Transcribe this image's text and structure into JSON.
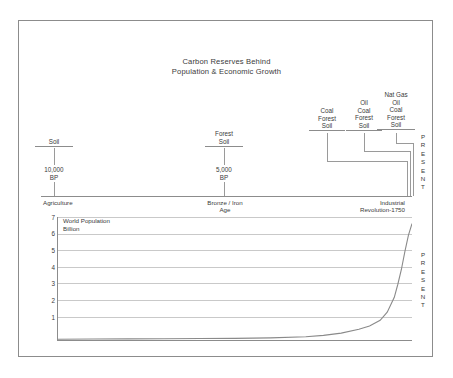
{
  "title": {
    "line1": "Carbon Reserves Behind",
    "line2": "Population & Economic Growth"
  },
  "reserve_groups": [
    {
      "name": "group-soil-10000bp",
      "lines": [
        "Soil"
      ],
      "marker": "10,000\nBP",
      "marker_line1": "10,000",
      "marker_line2": "BP"
    },
    {
      "name": "group-forest-soil-5000bp",
      "lines": [
        "Forest",
        "Soil"
      ],
      "marker_line1": "5,000",
      "marker_line2": "BP"
    },
    {
      "name": "group-coal-forest-soil",
      "lines": [
        "Coal",
        "Forest",
        "Soil"
      ]
    },
    {
      "name": "group-oil-coal-forest-soil",
      "lines": [
        "Oil",
        "Coal",
        "Forest",
        "Soil"
      ]
    },
    {
      "name": "group-natgas-oil-coal-forest-soil",
      "lines": [
        "Nat Gas",
        "Oil",
        "Coal",
        "Forest",
        "Soil"
      ]
    }
  ],
  "labels": {
    "soil": "Soil",
    "forest": "Forest",
    "coal": "Coal",
    "oil": "Oil",
    "nat_gas": "Nat Gas",
    "bp_10000_l1": "10,000",
    "bp_10000_l2": "BP",
    "bp_5000_l1": "5,000",
    "bp_5000_l2": "BP",
    "present": "PRESENT"
  },
  "eras": [
    {
      "label": "Agriculture",
      "align": "left"
    },
    {
      "label_line1": "Bronze / Iron",
      "label_line2": "Age",
      "align": "center"
    },
    {
      "label_line1": "Industrial",
      "label_line2": "Revolution-1750",
      "align": "right"
    }
  ],
  "era_text": {
    "agriculture": "Agriculture",
    "bronze_iron_1": "Bronze / Iron",
    "bronze_iron_2": "Age",
    "industrial_1": "Industrial",
    "industrial_2": "Revolution-1750"
  },
  "chart_data": {
    "type": "line",
    "title": "World Population",
    "subtitle": "Billion",
    "ylabel_line1": "World Population",
    "ylabel_line2": "Billion",
    "xlabel": "",
    "ylim": [
      0,
      7.5
    ],
    "yticks": [
      7,
      6,
      5,
      4,
      3,
      2,
      1
    ],
    "ytick_labels": [
      "7",
      "6",
      "5",
      "4",
      "3",
      "2",
      "1"
    ],
    "grid": true,
    "legend": "none",
    "x": [
      0,
      10,
      20,
      30,
      40,
      50,
      60,
      70,
      75,
      80,
      85,
      88,
      91,
      93,
      95,
      96,
      97,
      98,
      99,
      100
    ],
    "values": [
      0.05,
      0.06,
      0.07,
      0.08,
      0.09,
      0.1,
      0.13,
      0.2,
      0.28,
      0.42,
      0.65,
      0.85,
      1.2,
      1.7,
      2.6,
      3.4,
      4.3,
      5.4,
      6.4,
      7.1
    ],
    "series": [
      {
        "name": "World Population (Billion)",
        "values": [
          0.05,
          0.06,
          0.07,
          0.08,
          0.09,
          0.1,
          0.13,
          0.2,
          0.28,
          0.42,
          0.65,
          0.85,
          1.2,
          1.7,
          2.6,
          3.4,
          4.3,
          5.4,
          6.4,
          7.1
        ]
      }
    ],
    "annotations": [
      "PRESENT"
    ]
  },
  "colors": {
    "border": "#8c8c8c",
    "gridline": "#c9c9c9",
    "text": "#3a3a3a",
    "curve": "#8a8a8a",
    "background": "#ffffff"
  }
}
